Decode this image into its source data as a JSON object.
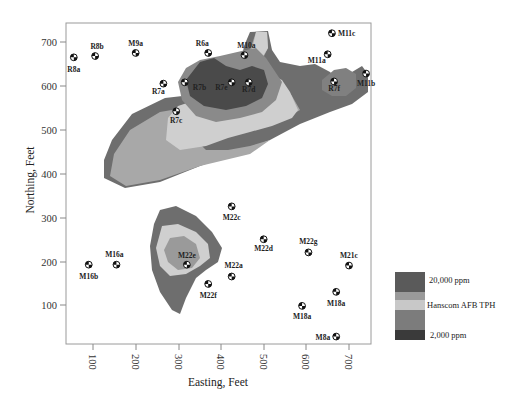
{
  "chart_data": {
    "type": "contour",
    "title": "",
    "xlabel": "Easting, Feet",
    "ylabel": "Northing, Feet",
    "xlim": [
      40,
      750
    ],
    "ylim": [
      20,
      740
    ],
    "x_ticks": [
      100,
      200,
      300,
      400,
      500,
      600,
      700
    ],
    "y_ticks": [
      100,
      200,
      300,
      400,
      500,
      600,
      700
    ],
    "grid": false,
    "legend": {
      "position": "right",
      "title": "Hanscom AFB TPH",
      "top_label": "20,000 ppm",
      "bottom_label": "2,000 ppm",
      "bands": [
        {
          "color": "#5a5a5a"
        },
        {
          "color": "#9a9a9a"
        },
        {
          "color": "#c8c8c8"
        },
        {
          "color": "#7c7c7c"
        },
        {
          "color": "#3a3a3a"
        }
      ]
    },
    "contour_colors": {
      "outer": "#6e6e6e",
      "mid": "#a8a8a8",
      "light": "#cfcfcf",
      "inner": "#8a8a8a",
      "core": "#4a4a4a"
    },
    "wells": [
      {
        "name": "R8a",
        "x": 55,
        "y": 665
      },
      {
        "name": "R8b",
        "x": 105,
        "y": 668
      },
      {
        "name": "M9a",
        "x": 200,
        "y": 675
      },
      {
        "name": "R6a",
        "x": 370,
        "y": 675
      },
      {
        "name": "M10a",
        "x": 455,
        "y": 670
      },
      {
        "name": "M11c",
        "x": 660,
        "y": 720
      },
      {
        "name": "M11a",
        "x": 650,
        "y": 672
      },
      {
        "name": "M11b",
        "x": 740,
        "y": 628
      },
      {
        "name": "R7a",
        "x": 265,
        "y": 605
      },
      {
        "name": "R7b",
        "x": 315,
        "y": 608
      },
      {
        "name": "R7e",
        "x": 425,
        "y": 608
      },
      {
        "name": "R7d",
        "x": 465,
        "y": 608
      },
      {
        "name": "R7f",
        "x": 665,
        "y": 610
      },
      {
        "name": "R7c",
        "x": 295,
        "y": 542
      },
      {
        "name": "M22c",
        "x": 425,
        "y": 325
      },
      {
        "name": "M22d",
        "x": 500,
        "y": 250
      },
      {
        "name": "M22g",
        "x": 605,
        "y": 220
      },
      {
        "name": "M21c",
        "x": 700,
        "y": 190
      },
      {
        "name": "M16a",
        "x": 155,
        "y": 192
      },
      {
        "name": "M16b",
        "x": 90,
        "y": 192
      },
      {
        "name": "M22e",
        "x": 320,
        "y": 192
      },
      {
        "name": "M22a",
        "x": 425,
        "y": 165
      },
      {
        "name": "M22f",
        "x": 370,
        "y": 148
      },
      {
        "name": "M18a",
        "x": 670,
        "y": 130
      },
      {
        "name": "M18a",
        "x": 590,
        "y": 98
      },
      {
        "name": "M8a",
        "x": 670,
        "y": 28
      }
    ]
  }
}
